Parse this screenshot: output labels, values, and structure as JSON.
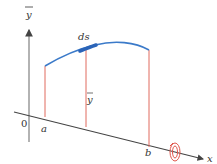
{
  "diagram": {
    "type": "surface-of-revolution",
    "labels": {
      "y_axis": "y",
      "y_axis_bar": true,
      "x_axis": "x",
      "origin": "0",
      "a": "a",
      "b": "b",
      "arc_element": "ds",
      "radius": "y",
      "radius_bar": true
    },
    "colors": {
      "axis": "#555555",
      "curve": "#3b7ac9",
      "ds_highlight": "#2b64b8",
      "vertical_lines": "#e06a5f",
      "rotation_arrow": "#e0564c",
      "text": "#333333"
    }
  }
}
